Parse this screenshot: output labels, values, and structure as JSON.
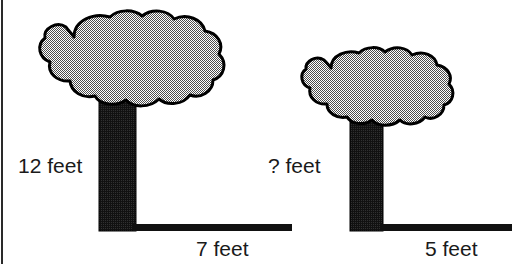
{
  "figure": {
    "type": "geometry-word-problem-diagram",
    "background_color": "#ffffff",
    "width": 521,
    "height": 264,
    "clipped_top_text": "",
    "border": {
      "left_rule_color": "#2a2a2a"
    },
    "palette": {
      "canopy_fill": "#808080",
      "canopy_outline": "#000000",
      "trunk_fill": "#111111",
      "ground_line": "#111111",
      "label_text": "#1a1a1a"
    }
  },
  "trees": [
    {
      "id": "tree-left",
      "name": "tall tree",
      "height_label": "12 feet",
      "height_value": 12,
      "shadow_label": "7 feet",
      "shadow_value": 7,
      "units": "feet",
      "canopy": {
        "left": 28,
        "top": 14,
        "right": 210,
        "bottom": 108
      },
      "trunk": {
        "left": 99,
        "top": 98,
        "right": 136,
        "bottom": 231
      },
      "ground_line": {
        "x1": 135,
        "x2": 292,
        "y": 227,
        "thickness": 7
      }
    },
    {
      "id": "tree-right",
      "name": "short tree",
      "height_label": "? feet",
      "height_value": null,
      "shadow_label": "5 feet",
      "shadow_value": 5,
      "units": "feet",
      "canopy": {
        "left": 293,
        "top": 50,
        "right": 440,
        "bottom": 130
      },
      "trunk": {
        "left": 350,
        "top": 118,
        "right": 383,
        "bottom": 231
      },
      "ground_line": {
        "x1": 382,
        "x2": 512,
        "y": 227,
        "thickness": 7
      }
    }
  ],
  "labels": {
    "tree1_height": "12 feet",
    "tree1_shadow": "7 feet",
    "tree2_height": "? feet",
    "tree2_shadow": "5 feet"
  }
}
